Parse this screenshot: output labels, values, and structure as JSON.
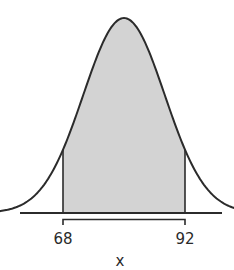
{
  "chart_data": {
    "type": "area",
    "title": "",
    "xlabel": "x",
    "ylabel": "",
    "mean": 80,
    "std_dev": 8,
    "shaded_region": {
      "from": 68,
      "to": 92
    },
    "tick_labels": [
      "68",
      "92"
    ],
    "x": [
      68,
      92
    ],
    "grid": false,
    "legend": null
  },
  "labels": {
    "left_bound": "68",
    "right_bound": "92",
    "axis": "x"
  },
  "colors": {
    "curve": "#2b2b2b",
    "shade": "#d3d3d3",
    "axis": "#2b2b2b"
  }
}
